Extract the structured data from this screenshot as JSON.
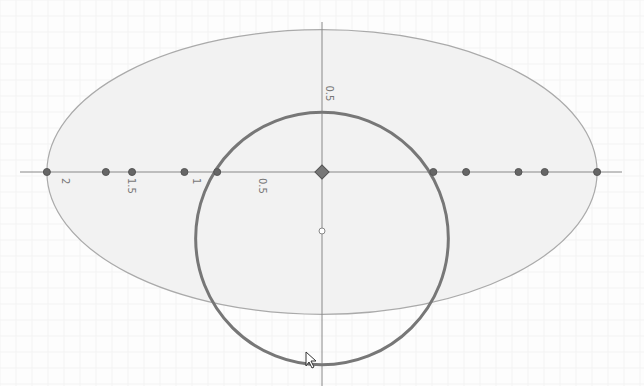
{
  "view": {
    "x_range": [
      -2.1,
      2.1
    ],
    "y_range": [
      -1.45,
      1.1
    ],
    "background": "#fdfdfd",
    "axis_color": "#888888"
  },
  "axis_labels": {
    "x": [
      {
        "value": -2,
        "label": "2"
      },
      {
        "value": -1.5,
        "label": "1.5"
      },
      {
        "value": -1,
        "label": "1"
      },
      {
        "value": -0.5,
        "label": "0.5"
      }
    ],
    "y": [
      {
        "value": 0.5,
        "label": "0.5"
      }
    ]
  },
  "shapes": {
    "ellipse": {
      "cx": 0,
      "cy": 0,
      "rx": 2.1,
      "ry": 1.07,
      "fill": "#f2f2f2",
      "stroke": "#aaaaaa"
    },
    "circle": {
      "cx": 0,
      "cy": -0.5,
      "r": 0.95,
      "stroke": "#777777"
    }
  },
  "points": [
    {
      "x": -2.1,
      "y": 0
    },
    {
      "x": -1.65,
      "y": 0
    },
    {
      "x": -1.45,
      "y": 0
    },
    {
      "x": -1.05,
      "y": 0
    },
    {
      "x": -0.8,
      "y": 0
    },
    {
      "x": 0.85,
      "y": 0
    },
    {
      "x": 1.1,
      "y": 0
    },
    {
      "x": 1.5,
      "y": 0
    },
    {
      "x": 1.7,
      "y": 0
    },
    {
      "x": 2.1,
      "y": 0
    }
  ],
  "origin_point": {
    "x": 0,
    "y": 0
  },
  "hollow_point": {
    "x": 0,
    "y": -0.45
  }
}
